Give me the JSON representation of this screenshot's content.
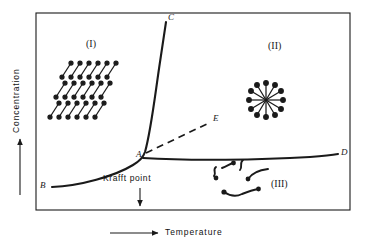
{
  "figure": {
    "type": "phase-diagram",
    "title": "",
    "axes": {
      "x": {
        "label": "Temperature",
        "arrow": "right-arrow-icon"
      },
      "y": {
        "label": "Concentration",
        "arrow": "up-arrow-icon"
      }
    },
    "frame": {
      "x": 36,
      "y": 13,
      "width": 314,
      "height": 197,
      "stroke": "#1a1a1a"
    },
    "annotations": {
      "krafft_point": {
        "label": "Krafft point",
        "arrow": "down-arrow-icon",
        "x": 140,
        "y": 180
      }
    },
    "regions": [
      {
        "id": "I",
        "label": "(I)",
        "x": 93,
        "y": 45,
        "description": "hydrated-solid-crystals"
      },
      {
        "id": "II",
        "label": "(II)",
        "x": 278,
        "y": 48,
        "description": "micelles"
      },
      {
        "id": "III",
        "label": "(III)",
        "x": 283,
        "y": 185,
        "description": "monomers"
      }
    ],
    "points": [
      {
        "id": "A",
        "label": "A",
        "x": 141,
        "y": 155,
        "style": "solid-junction"
      },
      {
        "id": "B",
        "label": "B",
        "x": 44,
        "y": 186,
        "style": "curve-end-left"
      },
      {
        "id": "C",
        "label": "C",
        "x": 200,
        "y": 20,
        "style": "curve-end-top"
      },
      {
        "id": "D",
        "label": "D",
        "x": 343,
        "y": 153,
        "style": "curve-end-right"
      },
      {
        "id": "E",
        "label": "E",
        "x": 216,
        "y": 119,
        "style": "dashed-end"
      }
    ],
    "curves": [
      {
        "id": "BAC",
        "name": "solubility-krafft-curve",
        "from": "B",
        "through": "A",
        "to": "C",
        "dash": false
      },
      {
        "id": "AD",
        "name": "cmc-curve",
        "from": "A",
        "to": "D",
        "dash": false
      },
      {
        "id": "AE",
        "name": "dashed-extension",
        "from": "A",
        "to": "E",
        "dash": true
      }
    ],
    "colors": {
      "line": "#1a1a1a",
      "text": "#1a1a1a",
      "background": "#ffffff"
    }
  }
}
